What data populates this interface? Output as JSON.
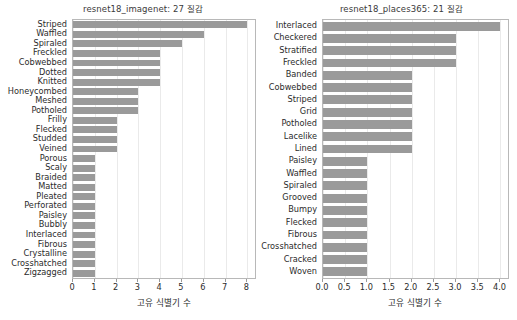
{
  "chart_data": [
    {
      "type": "bar",
      "orientation": "horizontal",
      "title": "resnet18_imagenet: 27 질감",
      "xlabel": "고유 식별기 수",
      "ylabel": "",
      "xlim": [
        0,
        8.35
      ],
      "xticks": [
        0,
        1,
        2,
        3,
        4,
        5,
        6,
        7,
        8
      ],
      "xticklabels": [
        "0",
        "1",
        "2",
        "3",
        "4",
        "5",
        "6",
        "7",
        "8"
      ],
      "grid": true,
      "legend": null,
      "bar_color": "#9a9a9a",
      "categories": [
        "Striped",
        "Waffled",
        "Spiraled",
        "Freckled",
        "Cobwebbed",
        "Dotted",
        "Knitted",
        "Honeycombed",
        "Meshed",
        "Potholed",
        "Frilly",
        "Flecked",
        "Studded",
        "Veined",
        "Porous",
        "Scaly",
        "Braided",
        "Matted",
        "Pleated",
        "Perforated",
        "Paisley",
        "Bubbly",
        "Interlaced",
        "Fibrous",
        "Crystalline",
        "Crosshatched",
        "Zigzagged"
      ],
      "values": [
        8,
        6,
        5,
        4,
        4,
        4,
        4,
        3,
        3,
        3,
        2,
        2,
        2,
        2,
        1,
        1,
        1,
        1,
        1,
        1,
        1,
        1,
        1,
        1,
        1,
        1,
        1
      ]
    },
    {
      "type": "bar",
      "orientation": "horizontal",
      "title": "resnet18_places365: 21 질감",
      "xlabel": "고유 식별기 수",
      "ylabel": "",
      "xlim": [
        0,
        4.17
      ],
      "xticks": [
        0,
        0.5,
        1.0,
        1.5,
        2.0,
        2.5,
        3.0,
        3.5,
        4.0
      ],
      "xticklabels": [
        "0.0",
        "0.5",
        "1.0",
        "1.5",
        "2.0",
        "2.5",
        "3.0",
        "3.5",
        "4.0"
      ],
      "grid": true,
      "legend": null,
      "bar_color": "#9a9a9a",
      "categories": [
        "Interlaced",
        "Checkered",
        "Stratified",
        "Freckled",
        "Banded",
        "Cobwebbed",
        "Striped",
        "Grid",
        "Potholed",
        "Lacelike",
        "Lined",
        "Paisley",
        "Waffled",
        "Spiraled",
        "Grooved",
        "Bumpy",
        "Flecked",
        "Fibrous",
        "Crosshatched",
        "Cracked",
        "Woven"
      ],
      "values": [
        4,
        3,
        3,
        3,
        2,
        2,
        2,
        2,
        2,
        2,
        2,
        1,
        1,
        1,
        1,
        1,
        1,
        1,
        1,
        1,
        1
      ]
    }
  ]
}
